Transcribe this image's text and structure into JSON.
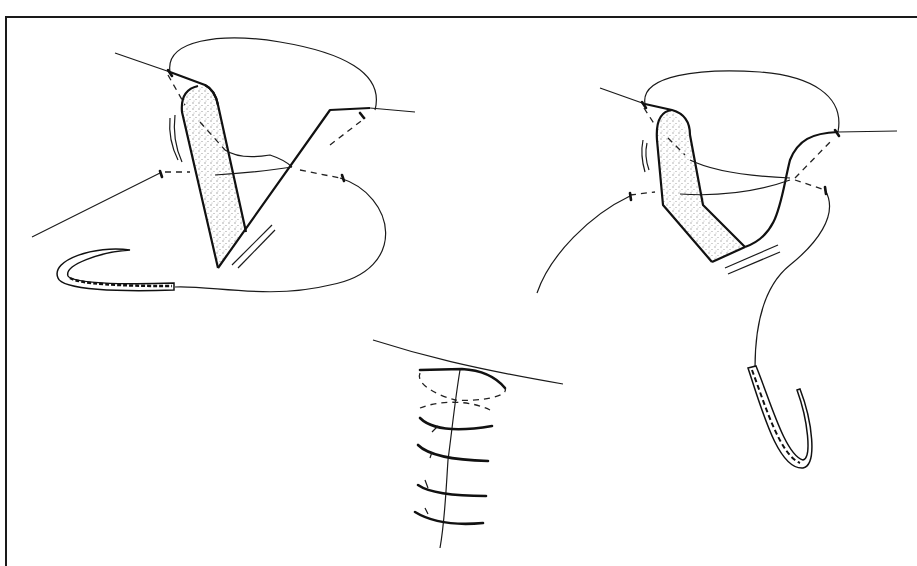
{
  "figure": {
    "type": "surgical-technique-line-drawing",
    "panels": [
      {
        "id": "left",
        "subject": "V-shaped wound flap with suture loop and curved needle (needle lower left)"
      },
      {
        "id": "right",
        "subject": "bent flap with suture loops and curved needle hanging lower right"
      },
      {
        "id": "bottom-center",
        "subject": "closed wound with tied sutures; 1 top buried stitch and 4 tied stitches along vertical line"
      }
    ],
    "text": [],
    "colors": {
      "ink": "#1a1a1a",
      "background": "#ffffff",
      "frame": "#1a1a1a"
    },
    "stitch_count_bottom": 5
  }
}
